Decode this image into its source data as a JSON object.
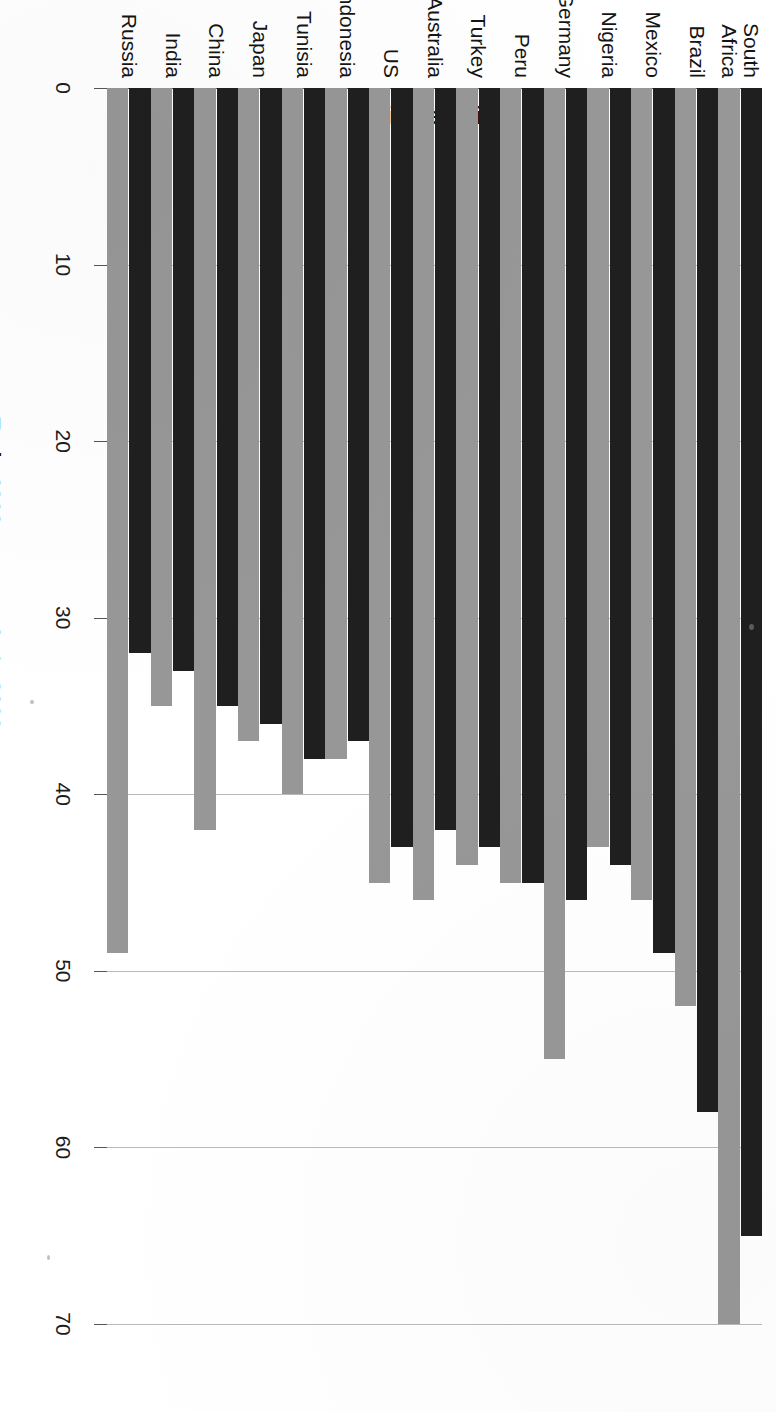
{
  "chart_data": {
    "type": "bar",
    "orientation": "horizontal-rotated",
    "title": "",
    "xlabel": "",
    "ylabel": "Gini coefficient",
    "ylim": [
      0,
      70
    ],
    "yticks": [
      0,
      10,
      20,
      30,
      40,
      50,
      60,
      70
    ],
    "grid": true,
    "legend_position": "bottom",
    "categories": [
      "Russia",
      "India",
      "China",
      "Japan",
      "Tunisia",
      "Indonesia",
      "US",
      "Australia",
      "Turkey",
      "Peru",
      "Germany",
      "Nigeria",
      "Mexico",
      "Brazil",
      "South Africa"
    ],
    "series": [
      {
        "name": "Early 1990s",
        "color": "#1f1f1f",
        "values": [
          32,
          33,
          35,
          36,
          38,
          37,
          43,
          42,
          43,
          45,
          46,
          44,
          49,
          58,
          65
        ]
      },
      {
        "name": "Late 2000s",
        "color": "#979797",
        "values": [
          49,
          35,
          42,
          37,
          40,
          38,
          45,
          46,
          44,
          45,
          55,
          43,
          46,
          52,
          70
        ]
      }
    ]
  },
  "axis": {
    "y_title": "Gini coefficient",
    "tick_labels": [
      "0",
      "10",
      "20",
      "30",
      "40",
      "50",
      "60",
      "70"
    ]
  },
  "legend": {
    "items": [
      {
        "label": "Early 1990s",
        "swatch": "dark"
      },
      {
        "label": "Late 2000s",
        "swatch": "gray"
      }
    ]
  },
  "category_labels": [
    "Russia",
    "India",
    "China",
    "Japan",
    "Tunisia",
    "Indonesia",
    "US",
    "Australia",
    "Turkey",
    "Peru",
    "Germany",
    "Nigeria",
    "Mexico",
    "Brazil",
    "South\nAfrica"
  ]
}
